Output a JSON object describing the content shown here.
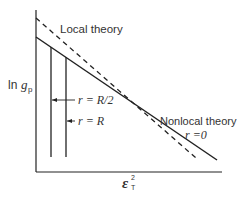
{
  "diagram": {
    "y_axis_label": {
      "prefix": "ln ",
      "symbol": "g",
      "subscript": "p"
    },
    "x_axis_label": {
      "symbol": "ε",
      "superscript": "2",
      "subscript": "T"
    },
    "labels": {
      "local_theory": "Local theory",
      "nonlocal_theory": "Nonlocal theory",
      "r_zero": "r =0",
      "r_half_R": "r = R/2",
      "r_R": "r = R"
    },
    "colors": {
      "line": "#222222",
      "text": "#333333",
      "background": "#ffffff"
    },
    "lines": [
      {
        "name": "local-theory",
        "style": "dashed",
        "from": [
          36,
          18
        ],
        "to": [
          196,
          158
        ]
      },
      {
        "name": "nonlocal-theory",
        "style": "solid",
        "from": [
          36,
          37
        ],
        "to": [
          217,
          160
        ]
      }
    ],
    "verticals": [
      {
        "name": "r-equals-R",
        "x": 51
      },
      {
        "name": "r-equals-R-half",
        "x": 66
      }
    ]
  }
}
